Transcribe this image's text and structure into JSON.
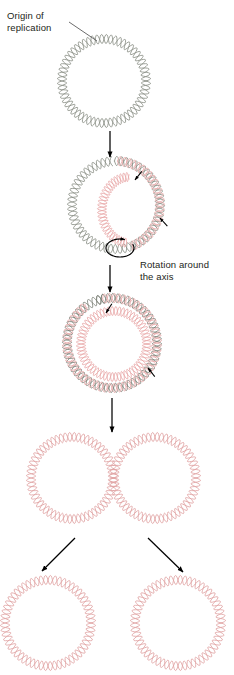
{
  "diagram": {
    "title_visible": false,
    "background": "#ffffff",
    "type": "biology-process-diagram"
  },
  "labels": {
    "origin": "Origin of\nreplication",
    "rotation": "Rotation around\nthe axis"
  },
  "colors": {
    "parental_strand": "#8a8f85",
    "daughter_strand": "#e8a9a9",
    "arrow": "#000000",
    "text": "#231f20",
    "leader": "#5b5b5b"
  },
  "style": {
    "helix_stroke": 0.85,
    "helix_amplitude": 4.6,
    "helix_waves_per_circle": 30
  },
  "stages": [
    {
      "id": "stage-1-unreplicated-circle",
      "caption": "Unreplicated circular chromosome with origin of replication",
      "cx": 104,
      "cy": 81,
      "r": 42,
      "strands": [
        {
          "name": "parental",
          "color": "#8a8f85",
          "from_deg": 0,
          "to_deg": 360
        }
      ]
    },
    {
      "id": "stage-2-theta-replication-bubble",
      "caption": "Replication bubble forms; theta structure",
      "cx": 116,
      "cy": 205,
      "r": 44,
      "strands": [
        {
          "name": "parental",
          "color": "#8a8f85",
          "from_deg": 268,
          "to_deg": 625
        },
        {
          "name": "daughter",
          "color": "#e8a9a9",
          "from_deg": 272,
          "to_deg": 430
        }
      ],
      "inner_loop": {
        "cx": 129,
        "cy": 210,
        "rx": 27,
        "ry": 33,
        "color": "#e8a9a9",
        "from_deg": 95,
        "to_deg": 270
      },
      "fork_arrows": [
        {
          "x": 135,
          "y": 180,
          "angle_deg": -52
        },
        {
          "x": 160,
          "y": 218,
          "angle_deg": 48
        }
      ],
      "rotation_arrow": {
        "cx": 120,
        "cy": 248,
        "rx": 14,
        "ry": 9
      }
    },
    {
      "id": "stage-3-near-complete-replication",
      "caption": "Replication nearly complete; two concentric daughter loops",
      "cx": 112,
      "cy": 343,
      "r": 45,
      "strands": [
        {
          "name": "parental",
          "color": "#7d8279",
          "from_deg": 250,
          "to_deg": 620
        },
        {
          "name": "daughter",
          "color": "#e8a9a9",
          "from_deg": 258,
          "to_deg": 595
        }
      ],
      "inner_loop": {
        "cx": 114,
        "cy": 344,
        "rx": 33,
        "ry": 33,
        "color": "#e8a9a9",
        "from_deg": 0,
        "to_deg": 360
      },
      "fork_arrows": [
        {
          "x": 106,
          "y": 313,
          "angle_deg": -58
        },
        {
          "x": 148,
          "y": 368,
          "angle_deg": 52
        }
      ]
    },
    {
      "id": "stage-4-two-interlocked-circles",
      "caption": "Two completed circular chromosomes still joined",
      "circles": [
        {
          "cx": 72,
          "cy": 478,
          "r": 41,
          "color": "#e0a3a3"
        },
        {
          "cx": 155,
          "cy": 478,
          "r": 41,
          "color": "#e0a3a3"
        }
      ]
    },
    {
      "id": "stage-5-separated-daughter-chromosomes",
      "caption": "Separated daughter chromosomes",
      "circles": [
        {
          "cx": 48,
          "cy": 623,
          "r": 43,
          "color": "#e0a3a3"
        },
        {
          "cx": 178,
          "cy": 623,
          "r": 43,
          "color": "#e0a3a3"
        }
      ]
    }
  ],
  "connectors": [
    {
      "id": "leader-origin",
      "type": "leader-line",
      "x1": 69,
      "y1": 22,
      "x2": 97,
      "y2": 41
    },
    {
      "id": "arrow-stage1-to-stage2",
      "type": "arrow-down",
      "x1": 110,
      "y1": 131,
      "x2": 110,
      "y2": 157
    },
    {
      "id": "arrow-stage2-to-stage3",
      "type": "arrow-down",
      "x1": 110,
      "y1": 265,
      "x2": 110,
      "y2": 292
    },
    {
      "id": "arrow-stage3-to-stage4",
      "type": "arrow-down",
      "x1": 112,
      "y1": 398,
      "x2": 112,
      "y2": 432
    },
    {
      "id": "arrow-stage4-to-left-daughter",
      "type": "arrow-diagonal",
      "x1": 75,
      "y1": 538,
      "x2": 42,
      "y2": 571
    },
    {
      "id": "arrow-stage4-to-right-daughter",
      "type": "arrow-diagonal",
      "x1": 148,
      "y1": 538,
      "x2": 183,
      "y2": 572
    }
  ]
}
